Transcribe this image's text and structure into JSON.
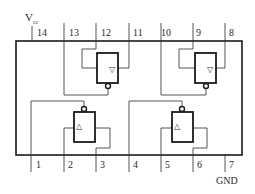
{
  "power": {
    "label": "V",
    "subscript": "cc",
    "pin": "14"
  },
  "ground": {
    "label": "GND",
    "pin": "7"
  },
  "top_pins": [
    "14",
    "13",
    "12",
    "11",
    "10",
    "9",
    "8"
  ],
  "bottom_pins": [
    "1",
    "2",
    "3",
    "4",
    "5",
    "6",
    "7"
  ],
  "gates": [
    {
      "id": "gate-1",
      "position": "bottom-left",
      "symbol": "△",
      "enable_pin": "1",
      "input_pin": "2",
      "output_pin": "3"
    },
    {
      "id": "gate-2",
      "position": "bottom-right",
      "symbol": "△",
      "enable_pin": "4",
      "input_pin": "5",
      "output_pin": "6"
    },
    {
      "id": "gate-3",
      "position": "top-left",
      "symbol": "▽",
      "enable_pin": "13",
      "input_pin": "12",
      "output_pin": "11"
    },
    {
      "id": "gate-4",
      "position": "top-right",
      "symbol": "▽",
      "enable_pin": "10",
      "input_pin": "9",
      "output_pin": "8"
    }
  ],
  "colors": {
    "line": "#1a1a1a",
    "wire": "#555555",
    "background": "#ffffff"
  }
}
